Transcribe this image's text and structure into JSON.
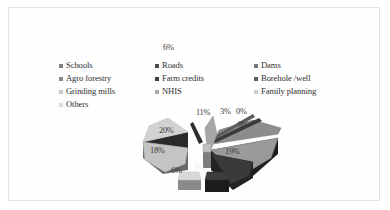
{
  "figure": {
    "background_color": "#ffffff",
    "frame_color": "#e2e2e2"
  },
  "stray_label": "6%",
  "legend": {
    "items": [
      {
        "label": "Schools",
        "color": "#808080"
      },
      {
        "label": "Roads",
        "color": "#4a4a4a"
      },
      {
        "label": "Dams",
        "color": "#777777"
      },
      {
        "label": "Agro forestry",
        "color": "#8c8c8c"
      },
      {
        "label": "Farm credits",
        "color": "#3c3c3c"
      },
      {
        "label": "Borehole /well",
        "color": "#5e5e5e"
      },
      {
        "label": "Grinding mills",
        "color": "#c8c8c8"
      },
      {
        "label": "NHIS",
        "color": "#a8a8a8"
      },
      {
        "label": "Family planning",
        "color": "#cfcfcf"
      },
      {
        "label": "Others",
        "color": "#dcdcdc"
      }
    ]
  },
  "chart_data": {
    "type": "pie",
    "title": "",
    "legend_position": "top",
    "exploded": true,
    "three_d": true,
    "categories": [
      "Schools",
      "Roads",
      "Dams",
      "Agro forestry",
      "Farm credits",
      "Borehole /well",
      "Grinding mills",
      "NHIS",
      "Family planning",
      "Others"
    ],
    "values": [
      11,
      3,
      0,
      9,
      19,
      8,
      6,
      18,
      20,
      6
    ],
    "value_labels": [
      "11%",
      "3%",
      "0%",
      "9%",
      "19%",
      "8%",
      "6%",
      "18%",
      "20%",
      "6%"
    ],
    "colors": [
      "#8f8f8f",
      "#474747",
      "#6f6f6f",
      "#a0a0a0",
      "#303030",
      "#5a5a5a",
      "#c4c4c4",
      "#b0b0b0",
      "#d2d2d2",
      "#e0e0e0"
    ],
    "units": "percent"
  },
  "pie_labels": [
    {
      "text": "11%",
      "x": 63,
      "y": 4,
      "dark": false
    },
    {
      "text": "3%",
      "x": 87,
      "y": 3,
      "dark": false
    },
    {
      "text": "0%",
      "x": 103,
      "y": 3,
      "dark": false
    },
    {
      "text": "9%",
      "x": 105,
      "y": 16,
      "dark": false
    },
    {
      "text": "19%",
      "x": 92,
      "y": 43,
      "dark": false
    },
    {
      "text": "8%",
      "x": 61,
      "y": 60,
      "dark": true
    },
    {
      "text": "6%",
      "x": 38,
      "y": 62,
      "dark": false
    },
    {
      "text": "18%",
      "x": 17,
      "y": 42,
      "dark": false
    },
    {
      "text": "20%",
      "x": 26,
      "y": 22,
      "dark": false
    }
  ]
}
